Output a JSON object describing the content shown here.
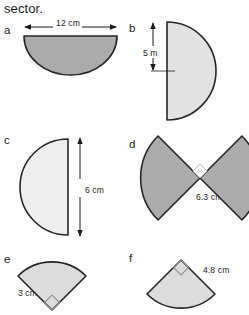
{
  "page": {
    "heading": "sector.",
    "background_color": "#ffffff",
    "stroke_color": "#1b1b1b",
    "fill_dark": "#ababab",
    "fill_light": "#dedede"
  },
  "figures": [
    {
      "key": "a",
      "label": "a",
      "shape": "semicircle",
      "orientation": "flat-top-bulge-down",
      "fill": "#ababab",
      "dimension": {
        "value": "12",
        "unit": "cm",
        "text": "12 cm",
        "arrow": "double-headed-horizontal",
        "position": "above"
      },
      "right_angle_mark": false
    },
    {
      "key": "b",
      "label": "b",
      "shape": "semicircle",
      "orientation": "flat-left-bulge-right",
      "fill": "#e2e2e2",
      "dimension": {
        "value": "5",
        "unit": "m",
        "text": "5 m",
        "arrow": "double-headed-vertical",
        "position": "left-radius"
      },
      "right_angle_mark": false
    },
    {
      "key": "c",
      "label": "c",
      "shape": "semicircle",
      "orientation": "flat-right-bulge-left",
      "fill": "#eeeeee",
      "dimension": {
        "value": "6",
        "unit": "cm",
        "text": "6 cm",
        "arrow": "double-headed-vertical",
        "position": "right-diameter"
      },
      "right_angle_mark": false
    },
    {
      "key": "d",
      "label": "d",
      "shape": "bowtie-two-quarter-sectors",
      "orientation": "apexes-meeting-at-centre",
      "fill": "#ababab",
      "dimension": {
        "value": "6.3",
        "unit": "cm",
        "text": "6.3 cm",
        "arrow": "none",
        "position": "lower-right-radius"
      },
      "right_angle_mark": true
    },
    {
      "key": "e",
      "label": "e",
      "shape": "quarter-sector",
      "orientation": "apex-bottom-opening-up",
      "fill": "#dcdcdc",
      "dimension": {
        "value": "3",
        "unit": "cm",
        "text": "3 cm",
        "arrow": "none",
        "position": "left-radius"
      },
      "right_angle_mark": true
    },
    {
      "key": "f",
      "label": "f",
      "shape": "quarter-sector",
      "orientation": "apex-top-opening-down",
      "fill": "#dcdcdc",
      "dimension": {
        "value": "4.8",
        "unit": "cm",
        "text": "4.8 cm",
        "arrow": "none",
        "position": "right-radius"
      },
      "right_angle_mark": true
    }
  ]
}
